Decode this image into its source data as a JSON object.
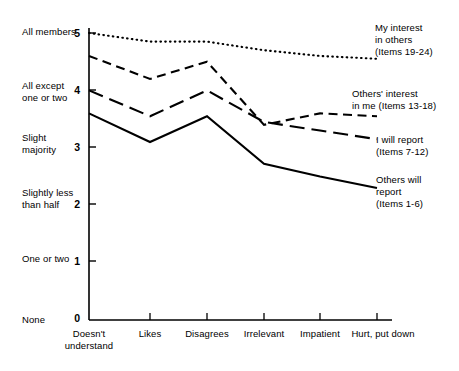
{
  "chart_data": {
    "type": "line",
    "title": "",
    "xlabel": "",
    "ylabel": "",
    "ylim": [
      0,
      5
    ],
    "grid": false,
    "legend_position": "right-inline",
    "categories": [
      "Doesn't understand",
      "Likes",
      "Disagrees",
      "Irrelevant",
      "Impatient",
      "Hurt, put down"
    ],
    "y_tick_values": [
      "0",
      "1",
      "2",
      "3",
      "4",
      "5"
    ],
    "y_tick_labels": [
      "None",
      "One or two",
      "Slightly less than half",
      "Slight majority",
      "All except one or two",
      "All members"
    ],
    "series": [
      {
        "name": "My interest in others",
        "items": "(Items 19-24)",
        "style": "dotted",
        "values": [
          5.0,
          4.85,
          4.85,
          4.7,
          4.6,
          4.55
        ]
      },
      {
        "name": "Others' interest in me",
        "items": "(Items 13-18)",
        "style": "short-dash",
        "values": [
          4.6,
          4.2,
          4.5,
          3.4,
          3.6,
          3.55
        ]
      },
      {
        "name": "I will report",
        "items": "(Items 7-12)",
        "style": "long-dash",
        "values": [
          4.0,
          3.55,
          4.0,
          3.45,
          3.3,
          3.15
        ]
      },
      {
        "name": "Others will report",
        "items": "(Items 1-6)",
        "style": "solid",
        "values": [
          3.6,
          3.1,
          3.55,
          2.72,
          2.5,
          2.3
        ]
      }
    ]
  },
  "y_categories": [
    {
      "tick": "5",
      "label1": "All members",
      "label2": ""
    },
    {
      "tick": "4",
      "label1": "All except",
      "label2": "one or two"
    },
    {
      "tick": "3",
      "label1": "Slight",
      "label2": "majority"
    },
    {
      "tick": "2",
      "label1": "Slightly less",
      "label2": "than half"
    },
    {
      "tick": "1",
      "label1": "One or two",
      "label2": ""
    },
    {
      "tick": "0",
      "label1": "None",
      "label2": ""
    }
  ],
  "x_categories": [
    {
      "line1": "Doesn't",
      "line2": "understand"
    },
    {
      "line1": "Likes",
      "line2": ""
    },
    {
      "line1": "Disagrees",
      "line2": ""
    },
    {
      "line1": "Irrelevant",
      "line2": ""
    },
    {
      "line1": "Impatient",
      "line2": ""
    },
    {
      "line1": "Hurt, put down",
      "line2": ""
    }
  ],
  "legends": [
    {
      "line1": "My interest",
      "line2": "in others",
      "line3": "(Items 19-24)"
    },
    {
      "line1": "Others' interest",
      "line2": "in me (Items 13-18)",
      "line3": ""
    },
    {
      "line1": "I will report",
      "line2": "(Items 7-12)",
      "line3": ""
    },
    {
      "line1": "Others will",
      "line2": "report",
      "line3": "(Items 1-6)"
    }
  ],
  "colors": {
    "ink": "#000000",
    "background": "#ffffff"
  }
}
